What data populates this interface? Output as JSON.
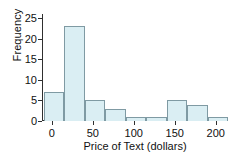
{
  "chart_data": {
    "type": "bar",
    "title": "",
    "xlabel": "Price of Text (dollars)",
    "ylabel": "Frequency",
    "xlim": [
      -12,
      215
    ],
    "ylim": [
      0,
      26
    ],
    "grid": false,
    "legend": null,
    "bin_width": 25,
    "bin_edges": [
      -10,
      15,
      40,
      65,
      90,
      115,
      140,
      165,
      190,
      215
    ],
    "categories": [
      "-10 to 15",
      "15 to 40",
      "40 to 65",
      "65 to 90",
      "90 to 115",
      "115 to 140",
      "140 to 165",
      "165 to 190",
      "190 to 215"
    ],
    "values": [
      7,
      23,
      5,
      3,
      1,
      1,
      5,
      4,
      1
    ],
    "xticks": [
      0,
      50,
      100,
      150,
      200
    ],
    "xtick_labels": [
      "0",
      "50",
      "100",
      "150",
      "200"
    ],
    "yticks": [
      0,
      5,
      10,
      15,
      20,
      25
    ],
    "ytick_labels": [
      "0",
      "5",
      "10",
      "15",
      "20",
      "25"
    ],
    "bar_fill_color": "#daeef3",
    "bar_edge_color": "#7f9aa3",
    "axis_color": "#2f2f2f",
    "text_color": "#111111",
    "background_color": "#ffffff"
  }
}
